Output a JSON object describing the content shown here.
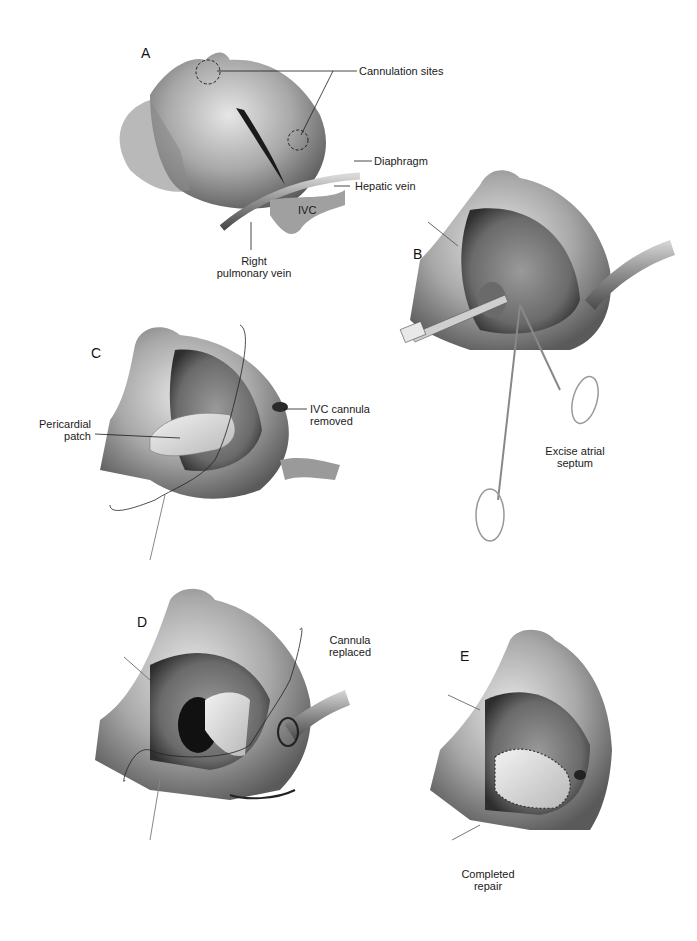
{
  "figure": {
    "panels": [
      {
        "id": "A",
        "letter": "A",
        "labels": {
          "cannulation_sites": "Cannulation sites",
          "diaphragm": "Diaphragm",
          "hepatic_vein": "Hepatic vein",
          "ivc": "IVC",
          "right_pulmonary_vein_line1": "Right",
          "right_pulmonary_vein_line2": "pulmonary vein"
        }
      },
      {
        "id": "B",
        "letter": "B",
        "labels": {
          "caption_line1": "Excise atrial",
          "caption_line2": "septum"
        }
      },
      {
        "id": "C",
        "letter": "C",
        "labels": {
          "pericardial_patch_line1": "Pericardial",
          "pericardial_patch_line2": "patch",
          "ivc_cannula_line1": "IVC cannula",
          "ivc_cannula_line2": "removed"
        }
      },
      {
        "id": "D",
        "letter": "D",
        "labels": {
          "cannula_line1": "Cannula",
          "cannula_line2": "replaced"
        }
      },
      {
        "id": "E",
        "letter": "E",
        "labels": {
          "caption_line1": "Completed",
          "caption_line2": "repair"
        }
      }
    ],
    "colors": {
      "tissue_light": "#d9d9d9",
      "tissue_mid": "#9a9a9a",
      "tissue_dark": "#3a3a3a",
      "line": "#1a1a1a",
      "background": "#ffffff"
    }
  }
}
